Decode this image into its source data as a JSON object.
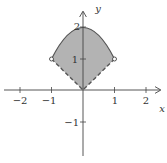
{
  "diagram": {
    "axes": {
      "x_label": "x",
      "y_label": "y",
      "x_ticks": [
        {
          "value": -2,
          "label": "−2"
        },
        {
          "value": -1,
          "label": "−1"
        },
        {
          "value": 1,
          "label": "1"
        },
        {
          "value": 2,
          "label": "2"
        }
      ],
      "y_ticks": [
        {
          "value": 1,
          "label": "1"
        },
        {
          "value": 2,
          "label": "2"
        },
        {
          "value": -1,
          "label": "−1"
        }
      ]
    },
    "region": {
      "upper_boundary": "y = 2 - x^2 (solid)",
      "lower_boundary": "y = |x| (dashed)",
      "open_points": [
        [
          -1,
          1
        ],
        [
          1,
          1
        ]
      ],
      "fill_color": "#b3b3b3",
      "stroke_color": "#555555"
    }
  }
}
